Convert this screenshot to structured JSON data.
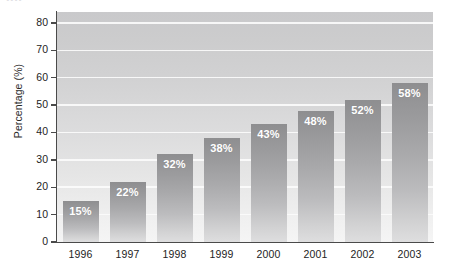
{
  "figure": {
    "clipped_title_remnant": "....",
    "background_color": "#ffffff"
  },
  "chart_data": {
    "type": "bar",
    "title": "",
    "xlabel": "",
    "ylabel": "Percentage (%)",
    "categories": [
      "1996",
      "1997",
      "1998",
      "1999",
      "2000",
      "2001",
      "2002",
      "2003"
    ],
    "values": [
      15,
      22,
      32,
      38,
      43,
      48,
      52,
      58
    ],
    "data_labels": [
      "15%",
      "22%",
      "32%",
      "38%",
      "43%",
      "48%",
      "52%",
      "58%"
    ],
    "ylim": [
      0,
      84
    ],
    "ytick_values": [
      0,
      10,
      20,
      30,
      40,
      50,
      60,
      70,
      80
    ],
    "ytick_labels": [
      "0",
      "10",
      "20",
      "30",
      "40",
      "50",
      "60",
      "70",
      "80"
    ],
    "grid": true,
    "gridline_color": "#fbfbfb",
    "legend": null,
    "bar_color_top": "#8e8e90",
    "bar_color_bottom": "#dededf",
    "plot_bg_top": "#c9c9cb",
    "plot_bg_bottom": "#f5f5f5",
    "axis_color": "#4a4a4a",
    "label_text_color": "#ffffff"
  }
}
